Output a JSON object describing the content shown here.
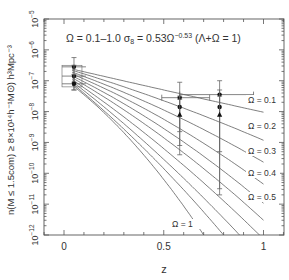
{
  "chart_data": {
    "type": "line",
    "title_parts": {
      "left": "Ω = 0.1–1.0 σ",
      "sub": "8",
      "mid": " = 0.53Ω",
      "sup": "−0.53",
      "right": " (Λ+Ω = 1)"
    },
    "xlabel": "z",
    "ylabel": "n(M ≤ 1.5_com) ≥ 8×10^14 h^-1 M_⊙) h^3 Mpc^-3",
    "ylabel_display": "n(M ≤ 1.5com) ≥ 8×10¹⁴h⁻¹M⊙) h³Mpc⁻³",
    "xlim": [
      -0.1,
      1.1
    ],
    "ylim_log10": [
      -12,
      -5
    ],
    "yscale": "log",
    "x_ticks": [
      0,
      0.5,
      1
    ],
    "x_tick_labels": [
      "0",
      "0.5",
      "1"
    ],
    "y_tick_exponents": [
      -5,
      -6,
      -7,
      -8,
      -9,
      -10,
      -11,
      -12
    ],
    "y_tick_labels": [
      "10−5",
      "10−6",
      "10−7",
      "10−8",
      "10−9",
      "10−10",
      "10−11",
      "10−12"
    ],
    "grid": false,
    "series": [
      {
        "name": "Ω = 0.1",
        "label": "Ω = 0.1",
        "z": [
          0.04,
          0.5,
          1.0
        ],
        "log10_n": [
          -6.62,
          -7.3,
          -8.02
        ]
      },
      {
        "name": "Ω = 0.2",
        "label": "Ω = 0.2",
        "z": [
          0.04,
          0.5,
          1.0
        ],
        "log10_n": [
          -6.66,
          -7.65,
          -8.93
        ]
      },
      {
        "name": "Ω = 0.3",
        "label": "Ω = 0.3",
        "z": [
          0.04,
          0.5,
          1.0
        ],
        "log10_n": [
          -6.72,
          -7.95,
          -9.64
        ]
      },
      {
        "name": "Ω = 0.4",
        "label": "Ω = 0.4",
        "z": [
          0.04,
          0.5,
          1.0
        ],
        "log10_n": [
          -6.78,
          -8.25,
          -10.35
        ]
      },
      {
        "name": "Ω = 0.5",
        "label": "Ω = 0.5",
        "z": [
          0.04,
          0.5,
          1.0
        ],
        "log10_n": [
          -6.84,
          -8.55,
          -10.97
        ]
      },
      {
        "name": "Ω = 0.6",
        "label": "",
        "z": [
          0.04,
          0.5,
          1.0
        ],
        "log10_n": [
          -6.9,
          -8.85,
          -11.52
        ]
      },
      {
        "name": "Ω = 0.7",
        "label": "",
        "z": [
          0.04,
          0.5,
          0.98
        ],
        "log10_n": [
          -6.96,
          -9.2,
          -12.0
        ]
      },
      {
        "name": "Ω = 0.8",
        "label": "",
        "z": [
          0.04,
          0.5,
          0.88
        ],
        "log10_n": [
          -7.02,
          -9.55,
          -12.0
        ]
      },
      {
        "name": "Ω = 0.9",
        "label": "",
        "z": [
          0.04,
          0.5,
          0.8
        ],
        "log10_n": [
          -7.08,
          -9.85,
          -12.0
        ]
      },
      {
        "name": "Ω = 1",
        "label": "Ω = 1",
        "z": [
          0.04,
          0.5,
          0.7
        ],
        "log10_n": [
          -7.14,
          -10.2,
          -12.0
        ]
      }
    ],
    "observations": [
      {
        "z": 0.05,
        "log10_n": -6.55,
        "marker": "circle",
        "z_err": 0.06,
        "log10_err": [
          -7.05,
          -6.25
        ]
      },
      {
        "z": 0.05,
        "log10_n": -6.85,
        "marker": "circle",
        "z_err": 0.06,
        "log10_err": [
          -7.3,
          -6.5
        ]
      },
      {
        "z": 0.05,
        "log10_n": -7.1,
        "marker": "circle",
        "z_err": 0.06,
        "log10_err": [
          -7.3,
          -6.8
        ]
      },
      {
        "z": 0.58,
        "log10_n": -7.55,
        "marker": "circle",
        "z_err_range": [
          0.49,
          0.73
        ],
        "log10_err": [
          -8.65,
          -7.05
        ]
      },
      {
        "z": 0.58,
        "log10_n": -7.85,
        "marker": "circle",
        "log10_err": [
          -9.1,
          -7.5
        ]
      },
      {
        "z": 0.58,
        "log10_n": -8.1,
        "marker": "triangle",
        "log10_err": [
          -9.4,
          -7.6
        ]
      },
      {
        "z": 0.78,
        "log10_n": -7.45,
        "marker": "circle",
        "z_err_range": [
          0.58,
          0.95
        ],
        "log10_err": [
          -10.5,
          -7.0
        ]
      },
      {
        "z": 0.78,
        "log10_n": -7.85,
        "marker": "circle",
        "log10_err": [
          -9.3,
          -7.3
        ]
      },
      {
        "z": 0.78,
        "log10_n": -8.1,
        "marker": "triangle",
        "log10_err": [
          -10.7,
          -7.5
        ]
      }
    ]
  }
}
